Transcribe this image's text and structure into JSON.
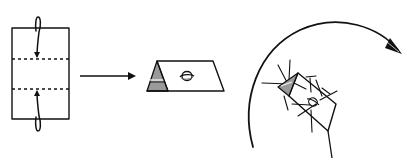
{
  "diagram": {
    "type": "origami-instruction",
    "steps": [
      {
        "id": "step-1",
        "description": "Rectangle with two horizontal dashed valley-fold lines; top and bottom edges fold toward the middle",
        "rect": {
          "x": 12,
          "y": 28,
          "w": 57,
          "h": 91
        },
        "dashed_lines_y": [
          59,
          89
        ],
        "fold_arrows": [
          {
            "from": "top",
            "to_y": 59
          },
          {
            "from": "bottom",
            "to_y": 89
          }
        ]
      },
      {
        "id": "arrow-to-step-2",
        "description": "Horizontal arrow pointing right",
        "from": [
          80,
          76
        ],
        "to": [
          135,
          76
        ]
      },
      {
        "id": "step-2",
        "description": "Folded paper viewed as a parallelogram with gray triangular end and a rotation symbol",
        "fill_gray": "#9a9a9a",
        "symbol": "rotate-symbol"
      },
      {
        "id": "step-3",
        "description": "Same shape tilted, surrounded by radiating lines, with a large curved clockwise arrow",
        "fill_gray": "#9a9a9a",
        "symbol": "rotate-symbol",
        "curved_arrow": "clockwise"
      }
    ],
    "colors": {
      "line": "#111111",
      "gray_fill": "#9a9a9a",
      "background": "#ffffff"
    }
  }
}
